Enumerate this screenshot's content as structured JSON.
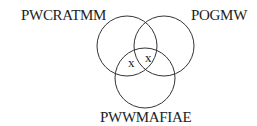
{
  "diagram": {
    "type": "venn",
    "sets": [
      {
        "label": "PWCRATMM",
        "position": "top-left"
      },
      {
        "label": "POGMW",
        "position": "top-right"
      },
      {
        "label": "PWWMAFIAE",
        "position": "bottom"
      }
    ],
    "marks": [
      {
        "symbol": "x",
        "region": "PWCRATMM ∩ PWWMAFIAE only"
      },
      {
        "symbol": "x",
        "region": "PWCRATMM ∩ POGMW ∩ PWWMAFIAE"
      }
    ],
    "stroke_color": "#333333",
    "background": "#ffffff"
  }
}
